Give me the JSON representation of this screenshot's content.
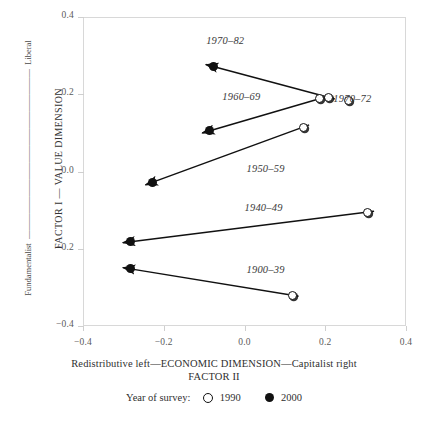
{
  "chart_data": {
    "type": "scatter",
    "title": "",
    "xlabel": "Redistributive left—ECONOMIC DIMENSION—Capitalist right",
    "xlabel_line2": "FACTOR II",
    "ylabel_inner": "FACTOR I — VALUE DIMENSION",
    "ylabel_outer_top": "Liberal",
    "ylabel_outer_bottom": "Fundamentalist",
    "xlim": [
      -0.4,
      0.4
    ],
    "ylim": [
      -0.4,
      0.4
    ],
    "xticks": [
      "-0.4",
      "-0.2",
      "0.0",
      "0.2",
      "0.4"
    ],
    "xtick_values": [
      -0.4,
      -0.2,
      0.0,
      0.2,
      0.4
    ],
    "yticks": [
      "0.4",
      "0.2",
      "0.0",
      "-0.2",
      "-0.4"
    ],
    "ytick_values": [
      0.4,
      0.2,
      0.0,
      -0.2,
      -0.4
    ],
    "grid": false,
    "legend_position": "below",
    "legend_title": "Year of survey:",
    "legend": [
      {
        "marker": "open-circle",
        "label": "1990"
      },
      {
        "marker": "filled-circle",
        "label": "2000"
      }
    ],
    "cohorts": [
      {
        "name": "1970–82",
        "label_x": -0.095,
        "label_y": 0.335,
        "p1990": {
          "x": 0.208,
          "y": 0.192
        },
        "p2000": {
          "x": -0.078,
          "y": 0.272
        },
        "has_arrow": true
      },
      {
        "name": "1960–69",
        "label_x": -0.055,
        "label_y": 0.19,
        "p1990": {
          "x": 0.185,
          "y": 0.188
        },
        "p2000": {
          "x": -0.087,
          "y": 0.105
        },
        "has_arrow": true
      },
      {
        "name": "1970–72",
        "label_x": 0.22,
        "label_y": 0.185,
        "p1990": {
          "x": 0.258,
          "y": 0.185
        },
        "p2000": null,
        "has_arrow": false
      },
      {
        "name": "1950–59",
        "label_x": 0.005,
        "label_y": 0.005,
        "p1990": {
          "x": 0.145,
          "y": 0.115
        },
        "p2000": {
          "x": -0.228,
          "y": -0.028
        },
        "has_arrow": true
      },
      {
        "name": "1940–49",
        "label_x": 0.0,
        "label_y": -0.098,
        "p1990": {
          "x": 0.305,
          "y": -0.105
        },
        "p2000": {
          "x": -0.283,
          "y": -0.182
        },
        "has_arrow": true
      },
      {
        "name": "1900–39",
        "label_x": 0.005,
        "label_y": -0.258,
        "p1990": {
          "x": 0.118,
          "y": -0.32
        },
        "p2000": {
          "x": -0.283,
          "y": -0.252
        },
        "has_arrow": true
      }
    ],
    "colors": {
      "marker": "#111111",
      "frame": "#d8d8d8",
      "text": "#2b2b2b",
      "tick_text": "#5a5a5a"
    }
  }
}
